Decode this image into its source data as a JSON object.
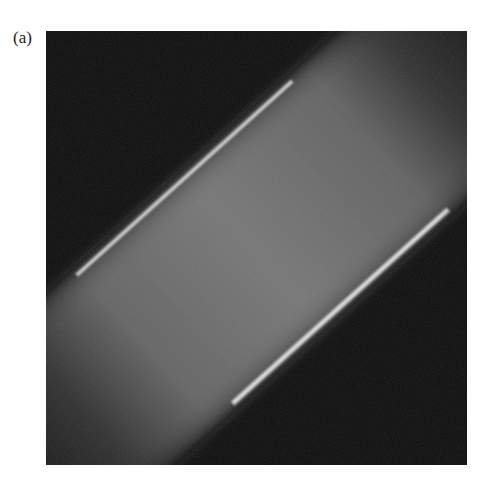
{
  "figure": {
    "panel_label": "(a)",
    "image": {
      "description": "Grayscale fluorescence micrograph of a tilted cylindrical cell segment showing a hexagonal honeycomb lattice of dark pores with bright walls, with diffuse fading ends",
      "background_color": "#0b0b0b",
      "wall_color": "#e6e6e6",
      "pore_color": "#3a3a3a",
      "band_rotation_deg": -42,
      "lattice_pitch_px": 14.5
    }
  }
}
